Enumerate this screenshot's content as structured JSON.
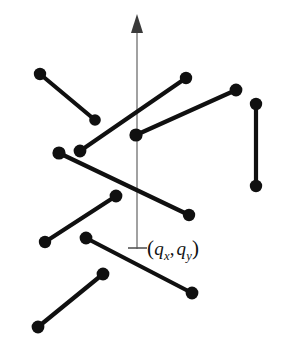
{
  "figure": {
    "background_color": "#ffffff",
    "width": 285,
    "height": 350,
    "segment_color": "#101010",
    "axis_color": "#8a8a8a",
    "label_color": "#111111"
  },
  "axis": {
    "name": "vertical-ray",
    "x": 137,
    "top_y": 14,
    "bottom_y": 249,
    "arrow_tip_y": 14,
    "arrow_base_y": 33,
    "arrow_half_width": 6,
    "tick": {
      "x1": 128,
      "x2": 147,
      "y": 248
    }
  },
  "query_point": {
    "name": "query-point-label",
    "text": "(qx, qy)",
    "parts": {
      "open_paren": "(",
      "q1": "q",
      "sub1": "x",
      "comma": ",",
      "q2": "q",
      "sub2": "y",
      "close_paren": ")"
    },
    "label_x": 147,
    "label_y": 236
  },
  "segments": [
    {
      "id": "segment-1",
      "name": "segment-top-left-descending",
      "x1": 40,
      "y1": 74,
      "x2": 95,
      "y2": 120,
      "dot_r1": 6.2,
      "dot_r2": 5.8
    },
    {
      "id": "segment-2",
      "name": "segment-long-ascending-left",
      "x1": 80,
      "y1": 151,
      "x2": 186,
      "y2": 78,
      "dot_r1": 6.4,
      "dot_r2": 6.2
    },
    {
      "id": "segment-3",
      "name": "segment-ascending-right",
      "x1": 136,
      "y1": 135,
      "x2": 236,
      "y2": 90,
      "dot_r1": 6.6,
      "dot_r2": 6.4
    },
    {
      "id": "segment-4",
      "name": "segment-vertical-right",
      "x1": 256,
      "y1": 104,
      "x2": 256,
      "y2": 186,
      "dot_r1": 6.2,
      "dot_r2": 6.2
    },
    {
      "id": "segment-5",
      "name": "segment-long-descending-middle",
      "x1": 59,
      "y1": 153,
      "x2": 189,
      "y2": 215,
      "dot_r1": 6.6,
      "dot_r2": 6.2
    },
    {
      "id": "segment-6",
      "name": "segment-lower-left-ascending",
      "x1": 45,
      "y1": 242,
      "x2": 116,
      "y2": 196,
      "dot_r1": 6.2,
      "dot_r2": 6.4
    },
    {
      "id": "segment-7",
      "name": "segment-lower-descending",
      "x1": 86,
      "y1": 238,
      "x2": 192,
      "y2": 293,
      "dot_r1": 6.4,
      "dot_r2": 6.4
    },
    {
      "id": "segment-8",
      "name": "segment-bottom-left-ascending",
      "x1": 38,
      "y1": 327,
      "x2": 103,
      "y2": 274,
      "dot_r1": 6.4,
      "dot_r2": 6.4
    }
  ],
  "chart_data": {
    "type": "scatter",
    "xlabel": "",
    "ylabel": "",
    "xlim": [
      0,
      285
    ],
    "ylim": [
      0,
      350
    ],
    "grid": false,
    "legend": null,
    "annotations": [
      "(qx, qy)"
    ],
    "series": [
      {
        "name": "line-segments",
        "kind": "segments",
        "points": [
          [
            40,
            74,
            95,
            120
          ],
          [
            80,
            151,
            186,
            78
          ],
          [
            136,
            135,
            236,
            90
          ],
          [
            256,
            104,
            256,
            186
          ],
          [
            59,
            153,
            189,
            215
          ],
          [
            45,
            242,
            116,
            196
          ],
          [
            86,
            238,
            192,
            293
          ],
          [
            38,
            327,
            103,
            274
          ]
        ]
      },
      {
        "name": "query-ray",
        "kind": "vertical-ray",
        "x": 137,
        "from_y": 249,
        "to_y": 14
      }
    ]
  }
}
